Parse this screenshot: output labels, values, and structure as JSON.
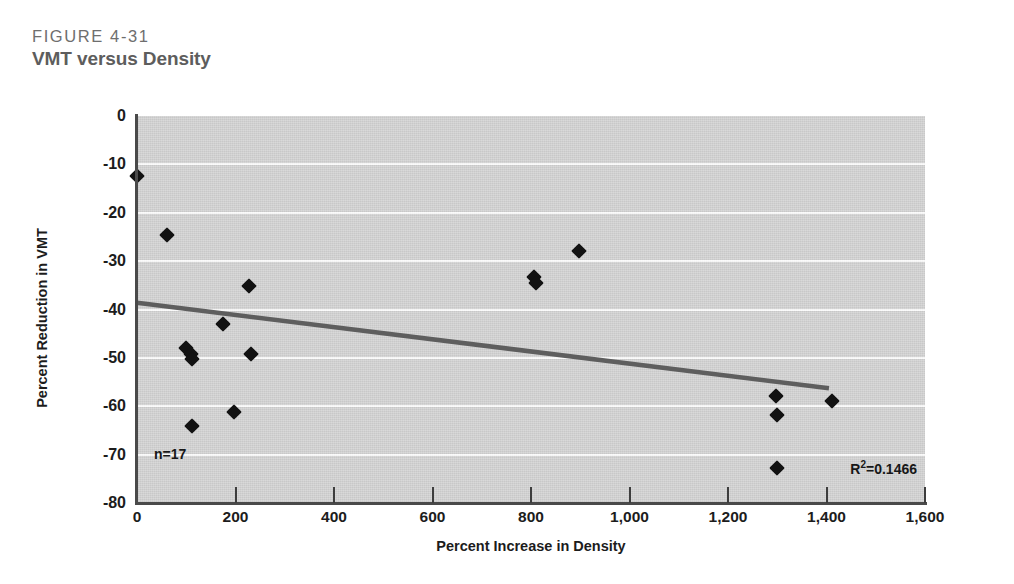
{
  "figure": {
    "number": "FIGURE 4-31",
    "title": "VMT versus Density"
  },
  "colors": {
    "plot_background": "#cfcfcf",
    "gridline": "#fbfbfb",
    "axis": "#4a4a4a",
    "marker": "#121212",
    "trendline": "#5e5e5e",
    "figure_number_text": "#6e6e6e",
    "figure_title_text": "#5d5d5d"
  },
  "chart_data": {
    "type": "scatter",
    "title": "VMT versus Density",
    "xlabel": "Percent Increase in Density",
    "ylabel": "Percent Reduction in VMT",
    "xlim": [
      0,
      1600
    ],
    "ylim": [
      -80,
      0
    ],
    "xticks": [
      0,
      200,
      400,
      600,
      800,
      1000,
      1200,
      1400,
      1600
    ],
    "xtick_labels": [
      "0",
      "200",
      "400",
      "600",
      "800",
      "1,000",
      "1,200",
      "1,400",
      "1,600"
    ],
    "yticks": [
      0,
      -10,
      -20,
      -30,
      -40,
      -50,
      -60,
      -70,
      -80
    ],
    "ytick_labels": [
      "0",
      "-10",
      "-20",
      "-30",
      "-40",
      "-50",
      "-60",
      "-70",
      "-80"
    ],
    "grid": "horizontal",
    "legend": "none",
    "points": [
      {
        "x": 0,
        "y": -12.3
      },
      {
        "x": 60,
        "y": -24.5
      },
      {
        "x": 100,
        "y": -48.0
      },
      {
        "x": 110,
        "y": -49.3
      },
      {
        "x": 112,
        "y": -50.2
      },
      {
        "x": 112,
        "y": -64.0
      },
      {
        "x": 174,
        "y": -43.1
      },
      {
        "x": 196,
        "y": -61.2
      },
      {
        "x": 227,
        "y": -35.2
      },
      {
        "x": 232,
        "y": -49.1
      },
      {
        "x": 806,
        "y": -33.3
      },
      {
        "x": 810,
        "y": -34.5
      },
      {
        "x": 897,
        "y": -28.0
      },
      {
        "x": 1298,
        "y": -57.8
      },
      {
        "x": 1300,
        "y": -61.8
      },
      {
        "x": 1300,
        "y": -72.7
      },
      {
        "x": 1412,
        "y": -59.0
      }
    ],
    "trendline": {
      "x0": 0,
      "y0": -38.6,
      "x1": 1405,
      "y1": -56.3
    },
    "annotations": {
      "n": "n=17",
      "r2_prefix": "R",
      "r2_exponent": "2",
      "r2_value": "=0.1466"
    }
  }
}
